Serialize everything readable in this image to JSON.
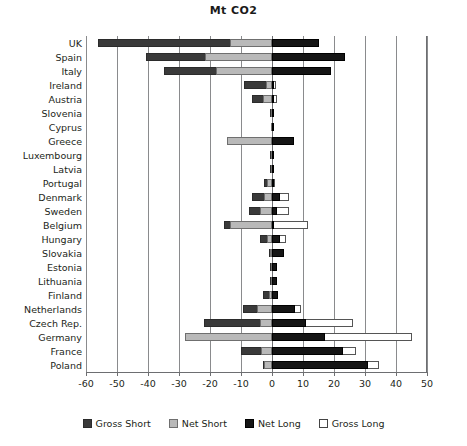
{
  "chart_data": {
    "type": "bar",
    "orientation": "horizontal",
    "title": "Mt CO2",
    "subtitle": "",
    "xlabel": "",
    "ylabel": "",
    "xlim": [
      -60,
      50
    ],
    "xticks": [
      -60,
      -50,
      -40,
      -30,
      -20,
      -10,
      0,
      10,
      20,
      30,
      40,
      50
    ],
    "xtick_labels": [
      "-60",
      "-50",
      "-40",
      "-30",
      "-20",
      "-10",
      "0",
      "10",
      "20",
      "30",
      "40",
      "50"
    ],
    "grid": true,
    "legend_position": "bottom",
    "legend": [
      {
        "name": "Gross Short",
        "color": "#3a3a3a"
      },
      {
        "name": "Net Short",
        "color": "#b9b9b9"
      },
      {
        "name": "Net Long",
        "color": "#151515"
      },
      {
        "name": "Gross Long",
        "color": "#ffffff"
      }
    ],
    "categories": [
      "UK",
      "Spain",
      "Italy",
      "Ireland",
      "Austria",
      "Slovenia",
      "Cyprus",
      "Greece",
      "Luxembourg",
      "Latvia",
      "Portugal",
      "Denmark",
      "Sweden",
      "Belgium",
      "Hungary",
      "Slovakia",
      "Estonia",
      "Lithuania",
      "Finland",
      "Netherlands",
      "Czech Rep.",
      "Germany",
      "France",
      "Poland"
    ],
    "series": [
      {
        "name": "Gross Short",
        "values": [
          -56.0,
          -40.5,
          -35.0,
          -9.0,
          -6.5,
          -0.6,
          -0.4,
          -14.5,
          -0.5,
          -0.5,
          -2.5,
          -6.5,
          -7.5,
          -15.5,
          -4.0,
          -1.0,
          -0.5,
          -0.5,
          -3.0,
          -9.5,
          -22.0,
          -28.0,
          -10.0,
          -3.0
        ]
      },
      {
        "name": "Net Short",
        "values": [
          -13.5,
          -21.5,
          -18.0,
          -2.0,
          -3.0,
          -0.3,
          -0.2,
          -14.5,
          -0.3,
          -0.3,
          -1.5,
          -2.5,
          -4.0,
          -13.5,
          -1.5,
          -0.5,
          -0.3,
          -0.3,
          -1.0,
          -5.0,
          -4.0,
          -28.0,
          -3.5,
          -2.5
        ]
      },
      {
        "name": "Net Long",
        "values": [
          15.0,
          23.5,
          19.0,
          0.8,
          0.7,
          0.3,
          0.2,
          7.0,
          0.3,
          0.3,
          0.6,
          2.5,
          1.5,
          0.5,
          2.5,
          4.0,
          1.5,
          1.5,
          2.0,
          7.5,
          11.0,
          17.0,
          23.0,
          31.0
        ]
      },
      {
        "name": "Gross Long",
        "values": [
          15.0,
          23.5,
          19.0,
          1.2,
          1.5,
          0.4,
          0.3,
          7.0,
          0.4,
          0.4,
          1.0,
          5.5,
          5.5,
          11.5,
          4.5,
          4.0,
          1.5,
          1.5,
          2.0,
          9.5,
          26.0,
          45.0,
          27.0,
          34.5
        ]
      }
    ]
  },
  "legend_labels": {
    "gross_short": "Gross Short",
    "net_short": "Net Short",
    "net_long": "Net Long",
    "gross_long": "Gross Long"
  }
}
